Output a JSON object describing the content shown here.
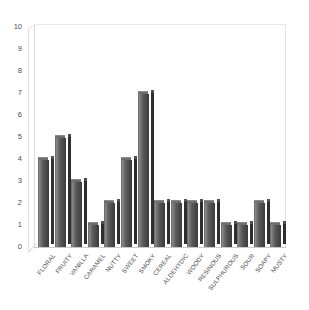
{
  "chart_data": {
    "type": "bar",
    "title": "",
    "subtitle": "",
    "xlabel": "",
    "ylabel": "",
    "ylim": [
      0,
      10
    ],
    "xlim": null,
    "grid": false,
    "legend": null,
    "legend_position": "none",
    "y_ticks": [
      "10",
      "9",
      "8",
      "7",
      "6",
      "5",
      "4",
      "3",
      "2",
      "1",
      "0"
    ],
    "y_tick_values": [
      10,
      9,
      8,
      7,
      6,
      5,
      4,
      3,
      2,
      1,
      0
    ],
    "categories": [
      "FLORAL",
      "FRUITY",
      "VANILLA",
      "CARAMEL",
      "NUTTY",
      "SWEET",
      "SMOKY",
      "CEREAL",
      "ALDEHYDIC",
      "WOODY",
      "RESINOUS",
      "SULPHUROUS",
      "SOUR",
      "SOAPY",
      "MUSTY"
    ],
    "values": [
      4,
      5,
      3,
      1,
      2,
      4,
      7,
      2,
      2,
      2,
      2,
      1,
      1,
      2,
      1
    ],
    "series": [
      {
        "name": "",
        "values": [
          4,
          5,
          3,
          1,
          2,
          4,
          7,
          2,
          2,
          2,
          2,
          1,
          1,
          2,
          1
        ]
      }
    ],
    "bar_style": "3d-column",
    "bar_color": "#5a5a5a",
    "bar_highlight_color": "#8e8e8e",
    "bar_shadow_color": "#2e2e2e",
    "axis_color": "#c9c9c9",
    "text_color": "#4a4a4a",
    "background_color": "#ffffff",
    "annotations": []
  }
}
